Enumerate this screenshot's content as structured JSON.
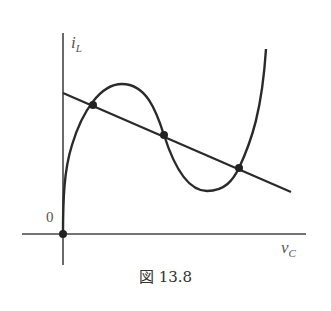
{
  "figure": {
    "caption": "図 13.8",
    "y_axis_label_main": "i",
    "y_axis_label_sub": "L",
    "x_axis_label_main": "v",
    "x_axis_label_sub": "C",
    "origin_label": "0"
  },
  "colors": {
    "stroke": "#2a2a2a",
    "axis": "#444444",
    "text": "#555555"
  },
  "curves": {
    "load_line": {
      "x1": 63,
      "y1": 93,
      "x2": 291,
      "y2": 192
    },
    "characteristic_path": "M63,234 C63,200 64,170 72,145 C82,112 100,84 122,84 C146,84 156,110 164,135 C172,160 185,191 207,191 C225,191 233,180 239,168 C252,140 262,110 266,49",
    "intersection_points": [
      {
        "x": 63,
        "y": 234
      },
      {
        "x": 93,
        "y": 105
      },
      {
        "x": 164,
        "y": 135
      },
      {
        "x": 239,
        "y": 168
      }
    ]
  }
}
